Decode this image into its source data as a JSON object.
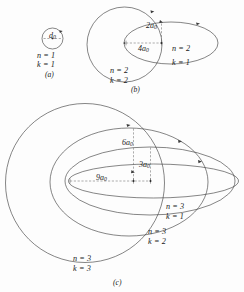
{
  "figure": {
    "background_color": "#fdfdfd",
    "line_color": "#3a3a3a",
    "dimension_line_color": "#6a6a6a"
  },
  "panels": [
    {
      "id": "a",
      "caption": "(a)",
      "orbits": [
        {
          "n_label": "n = 1",
          "k_label": "k = 1",
          "shape": "circle"
        }
      ],
      "dimensions": [
        {
          "label": "d",
          "subscript": "0",
          "full": "d0"
        }
      ]
    },
    {
      "id": "b",
      "caption": "(b)",
      "orbits": [
        {
          "n_label": "n = 2",
          "k_label": "k = 1",
          "shape": "ellipse"
        },
        {
          "n_label": "n = 2",
          "k_label": "k = 2",
          "shape": "circle"
        }
      ],
      "dimensions": [
        {
          "label": "2a",
          "subscript": "0",
          "full": "2a0"
        },
        {
          "label": "4a",
          "subscript": "0",
          "full": "4a0"
        }
      ]
    },
    {
      "id": "c",
      "caption": "(c)",
      "orbits": [
        {
          "n_label": "n = 3",
          "k_label": "k = 1",
          "shape": "ellipse"
        },
        {
          "n_label": "n = 3",
          "k_label": "k = 2",
          "shape": "ellipse"
        },
        {
          "n_label": "n = 3",
          "k_label": "k = 3",
          "shape": "circle"
        }
      ],
      "dimensions": [
        {
          "label": "6a",
          "subscript": "0",
          "full": "6a0"
        },
        {
          "label": "3a",
          "subscript": "0",
          "full": "3a0"
        },
        {
          "label": "9a",
          "subscript": "0",
          "full": "9a0"
        }
      ]
    }
  ],
  "labels": {
    "a_d0_main": "d",
    "a_d0_sub": "0",
    "a_n1": "n = 1",
    "a_k1": "k = 1",
    "a_caption": "(a)",
    "b_2a0_main": "2a",
    "b_2a0_sub": "0",
    "b_4a0_main": "4a",
    "b_4a0_sub": "0",
    "b_n2_k1_n": "n = 2",
    "b_n2_k1_k": "k = 1",
    "b_n2_k2_n": "n = 2",
    "b_n2_k2_k": "k = 2",
    "b_caption": "(b)",
    "c_6a0_main": "6a",
    "c_6a0_sub": "0",
    "c_3a0_main": "3a",
    "c_3a0_sub": "0",
    "c_9a0_main": "9a",
    "c_9a0_sub": "0",
    "c_n3_k1_n": "n = 3",
    "c_n3_k1_k": "k = 1",
    "c_n3_k2_n": "n = 3",
    "c_n3_k2_k": "k = 2",
    "c_n3_k3_n": "n = 3",
    "c_n3_k3_k": "k = 3",
    "c_caption": "(c)"
  }
}
